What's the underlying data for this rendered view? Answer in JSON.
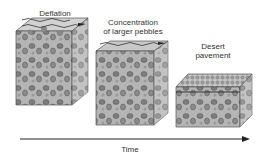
{
  "diagram": {
    "stages": [
      {
        "label": "Deflation"
      },
      {
        "label_line1": "Concentration",
        "label_line2": "of larger pebbles"
      },
      {
        "label_line1": "Desert",
        "label_line2": "pavement"
      }
    ],
    "axis_label": "Time",
    "colors": {
      "block_fill": "#b8b8b8",
      "top_fill": "#cfcfcf",
      "side_fill": "#8e8e8e",
      "pebble": "#7a7a7a",
      "outline": "#444444"
    }
  }
}
